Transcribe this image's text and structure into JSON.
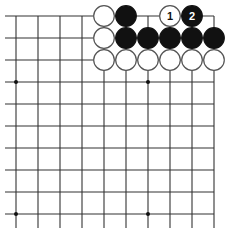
{
  "diagram": {
    "type": "go-board-fragment",
    "corner": "top-right",
    "grid": {
      "columns": 10,
      "rows": 10,
      "origin_x": 16,
      "origin_y": 16,
      "spacing": 22.0,
      "line_color": "#333333",
      "open_left": true,
      "open_bottom": true
    },
    "star_points": [
      {
        "col": 0,
        "row": 3
      },
      {
        "col": 6,
        "row": 3
      },
      {
        "col": 0,
        "row": 9
      },
      {
        "col": 6,
        "row": 9
      }
    ],
    "stones": [
      {
        "col": 4,
        "row": 0,
        "color": "white",
        "label": ""
      },
      {
        "col": 5,
        "row": 0,
        "color": "black",
        "label": ""
      },
      {
        "col": 7,
        "row": 0,
        "color": "white",
        "label": "1"
      },
      {
        "col": 8,
        "row": 0,
        "color": "black",
        "label": "2"
      },
      {
        "col": 4,
        "row": 1,
        "color": "white",
        "label": ""
      },
      {
        "col": 5,
        "row": 1,
        "color": "black",
        "label": ""
      },
      {
        "col": 6,
        "row": 1,
        "color": "black",
        "label": ""
      },
      {
        "col": 7,
        "row": 1,
        "color": "black",
        "label": ""
      },
      {
        "col": 8,
        "row": 1,
        "color": "black",
        "label": ""
      },
      {
        "col": 9,
        "row": 1,
        "color": "black",
        "label": ""
      },
      {
        "col": 4,
        "row": 2,
        "color": "white",
        "label": ""
      },
      {
        "col": 5,
        "row": 2,
        "color": "white",
        "label": ""
      },
      {
        "col": 6,
        "row": 2,
        "color": "white",
        "label": ""
      },
      {
        "col": 7,
        "row": 2,
        "color": "white",
        "label": ""
      },
      {
        "col": 8,
        "row": 2,
        "color": "white",
        "label": ""
      },
      {
        "col": 9,
        "row": 2,
        "color": "white",
        "label": ""
      }
    ],
    "colors": {
      "black_stone": "#111111",
      "white_stone": "#ffffff",
      "stone_outline": "#555555",
      "background": "#ffffff"
    }
  }
}
